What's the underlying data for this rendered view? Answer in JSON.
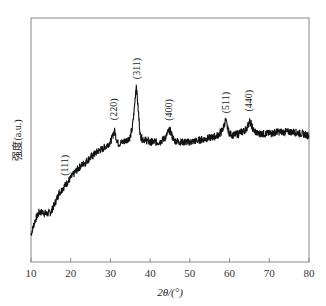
{
  "chart_data": {
    "type": "line",
    "title": "",
    "xlabel": "2θ/(°)",
    "ylabel": "强度(a.u.)",
    "xlim": [
      10,
      80
    ],
    "ylim": [
      0,
      100
    ],
    "xticks": [
      10,
      20,
      30,
      40,
      50,
      60,
      70,
      80
    ],
    "yticks": [],
    "grid": false,
    "legend": null,
    "series": [
      {
        "name": "XRD pattern",
        "color": "#111111",
        "x": [
          10,
          11,
          12,
          13,
          14,
          15,
          16,
          17,
          18,
          19,
          20,
          21,
          22,
          23,
          24,
          25,
          26,
          27,
          28,
          29,
          30,
          30.5,
          31,
          31.5,
          32,
          33,
          34,
          35,
          35.5,
          36,
          36.5,
          37,
          37.5,
          38,
          39,
          40,
          41,
          42,
          43,
          44,
          44.5,
          45,
          45.5,
          46,
          48,
          50,
          52,
          54,
          56,
          57,
          58,
          58.5,
          59,
          59.5,
          60,
          61,
          62,
          63,
          64,
          64.5,
          65,
          65.5,
          66,
          67,
          68,
          70,
          72,
          74,
          76,
          78,
          80
        ],
        "values": [
          12,
          20,
          25,
          25,
          24,
          25,
          30,
          36,
          39,
          42,
          45,
          48,
          51,
          53,
          55,
          57,
          59,
          61,
          62,
          64,
          66,
          69,
          73,
          68,
          65,
          66,
          67,
          69,
          74,
          85,
          100,
          85,
          70,
          68,
          67,
          66,
          66,
          66,
          67,
          69,
          72,
          73,
          70,
          67,
          66,
          66,
          67,
          68,
          69,
          70,
          72,
          75,
          79,
          74,
          71,
          70,
          71,
          72,
          73,
          75,
          78,
          76,
          73,
          71,
          71,
          71,
          72,
          72,
          72,
          71,
          70
        ]
      }
    ],
    "annotations": [
      {
        "text": "(111)",
        "x": 18.5
      },
      {
        "text": "(220)",
        "x": 31.0
      },
      {
        "text": "(311)",
        "x": 36.6
      },
      {
        "text": "(400)",
        "x": 44.8
      },
      {
        "text": "(511)",
        "x": 59.2
      },
      {
        "text": "(440)",
        "x": 65.0
      }
    ]
  },
  "axes": {
    "x_title": "2θ/(°)",
    "y_title": "强度(a.u.)"
  }
}
